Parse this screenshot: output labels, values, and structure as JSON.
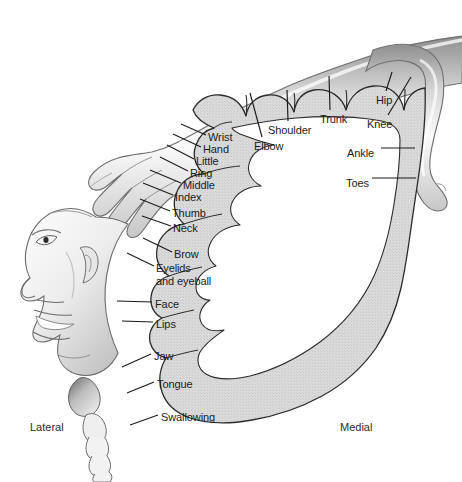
{
  "figure": {
    "colors": {
      "band_fill": "#d9d9d9",
      "band_outline": "#2b2b2b",
      "body_fill": "#f2f2f2",
      "body_shade": "#b9b9b9",
      "text": "#1b1b1b",
      "background": "#ffffff"
    }
  },
  "labels": [
    {
      "name": "wrist",
      "text": "Wrist",
      "x": 208,
      "y": 131,
      "leader": {
        "x1": 206,
        "y1": 135,
        "x2": 181,
        "y2": 124
      }
    },
    {
      "name": "hand",
      "text": "Hand",
      "x": 203,
      "y": 143,
      "leader": {
        "x1": 201,
        "y1": 147,
        "x2": 173,
        "y2": 134
      }
    },
    {
      "name": "little",
      "text": "Little",
      "x": 196,
      "y": 155,
      "leader": {
        "x1": 194,
        "y1": 159,
        "x2": 167,
        "y2": 145
      }
    },
    {
      "name": "ring",
      "text": "Ring",
      "x": 190,
      "y": 167,
      "leader": {
        "x1": 188,
        "y1": 171,
        "x2": 160,
        "y2": 157
      }
    },
    {
      "name": "middle",
      "text": "Middle",
      "x": 183,
      "y": 179,
      "leader": {
        "x1": 181,
        "y1": 183,
        "x2": 150,
        "y2": 170
      }
    },
    {
      "name": "index",
      "text": "Index",
      "x": 175,
      "y": 191,
      "leader": {
        "x1": 173,
        "y1": 195,
        "x2": 143,
        "y2": 183
      }
    },
    {
      "name": "thumb",
      "text": "Thumb",
      "x": 172,
      "y": 207,
      "leader": {
        "x1": 170,
        "y1": 211,
        "x2": 140,
        "y2": 199
      }
    },
    {
      "name": "neck",
      "text": "Neck",
      "x": 173,
      "y": 222,
      "leader": {
        "x1": 171,
        "y1": 226,
        "x2": 142,
        "y2": 216
      }
    },
    {
      "name": "brow",
      "text": "Brow",
      "x": 174,
      "y": 248,
      "leader": {
        "x1": 172,
        "y1": 252,
        "x2": 143,
        "y2": 238
      }
    },
    {
      "name": "eyelids-and-eyeball",
      "text": "Eyelids\nand eyeball",
      "x": 156,
      "y": 262,
      "leader": {
        "x1": 154,
        "y1": 266,
        "x2": 127,
        "y2": 253
      }
    },
    {
      "name": "face",
      "text": "Face",
      "x": 155,
      "y": 298,
      "leader": {
        "x1": 152,
        "y1": 302,
        "x2": 117,
        "y2": 301
      }
    },
    {
      "name": "lips",
      "text": "Lips",
      "x": 156,
      "y": 318,
      "leader": {
        "x1": 153,
        "y1": 322,
        "x2": 122,
        "y2": 321
      }
    },
    {
      "name": "jaw",
      "text": "Jaw",
      "x": 154,
      "y": 350,
      "leader": {
        "x1": 151,
        "y1": 354,
        "x2": 122,
        "y2": 367
      }
    },
    {
      "name": "tongue",
      "text": "Tongue",
      "x": 157,
      "y": 378,
      "leader": {
        "x1": 154,
        "y1": 382,
        "x2": 127,
        "y2": 393
      }
    },
    {
      "name": "swallowing",
      "text": "Swallowing",
      "x": 161,
      "y": 411,
      "leader": {
        "x1": 158,
        "y1": 415,
        "x2": 130,
        "y2": 425
      }
    },
    {
      "name": "elbow",
      "text": "Elbow",
      "x": 254,
      "y": 140,
      "leader": {
        "x1": 262,
        "y1": 137,
        "x2": 250,
        "y2": 93
      }
    },
    {
      "name": "shoulder",
      "text": "Shoulder",
      "x": 268,
      "y": 124,
      "leader": {
        "x1": 288,
        "y1": 121,
        "x2": 287,
        "y2": 90
      }
    },
    {
      "name": "trunk",
      "text": "Trunk",
      "x": 320,
      "y": 113,
      "leader": {
        "x1": 330,
        "y1": 110,
        "x2": 329,
        "y2": 76
      }
    },
    {
      "name": "hip",
      "text": "Hip",
      "x": 376,
      "y": 94,
      "leader": {
        "x1": 386,
        "y1": 91,
        "x2": 392,
        "y2": 72
      }
    },
    {
      "name": "knee",
      "text": "Knee",
      "x": 367,
      "y": 118,
      "leader": {
        "x1": 388,
        "y1": 115,
        "x2": 411,
        "y2": 77
      }
    },
    {
      "name": "ankle",
      "text": "Ankle",
      "x": 347,
      "y": 147,
      "leader": {
        "x1": 381,
        "y1": 148,
        "x2": 415,
        "y2": 148
      }
    },
    {
      "name": "toes",
      "text": "Toes",
      "x": 346,
      "y": 177,
      "leader": {
        "x1": 372,
        "y1": 178,
        "x2": 416,
        "y2": 178
      }
    }
  ],
  "orientation": {
    "lateral": {
      "text": "Lateral",
      "x": 30,
      "y": 421
    },
    "medial": {
      "text": "Medial",
      "x": 340,
      "y": 421
    }
  }
}
